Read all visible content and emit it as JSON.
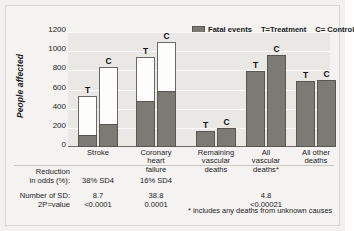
{
  "chart_data": {
    "type": "bar",
    "title": "",
    "ylabel": "People affected",
    "xlabel": "",
    "ylim": [
      0,
      1200
    ],
    "yticks": [
      1200,
      1000,
      800,
      600,
      400,
      200,
      0
    ],
    "grid": true,
    "legend_position": "top-right",
    "stacked": true,
    "categories": [
      "Stroke",
      "Coronary heart failure",
      "Remaining vascular deaths",
      "All vascular deaths*",
      "All other deaths"
    ],
    "category_lines": [
      [
        "Stroke"
      ],
      [
        "Coronary",
        "heart",
        "failure"
      ],
      [
        "Remaining",
        "vascular",
        "deaths"
      ],
      [
        "All",
        "vascular",
        "deaths*"
      ],
      [
        "All other",
        "deaths"
      ]
    ],
    "series": [
      {
        "name": "Treatment",
        "marker": "T",
        "totals": [
          530,
          940,
          165,
          790,
          685
        ],
        "fatal": [
          130,
          480,
          165,
          790,
          685
        ]
      },
      {
        "name": "Control",
        "marker": "C",
        "totals": [
          840,
          1100,
          195,
          960,
          700
        ],
        "fatal": [
          240,
          580,
          195,
          960,
          700
        ]
      }
    ],
    "legend": [
      {
        "icon": "fatal-events-swatch",
        "label": "Fatal events"
      },
      {
        "icon": "",
        "label": "T=Treatment"
      },
      {
        "icon": "",
        "label": "C= Control"
      }
    ],
    "colors": {
      "fatal": "#7b7a75",
      "nonfatal": "#fdfdfc",
      "plot_background": "#e9e8e5",
      "page_background": "#f4f3f1",
      "gridline": "#fafafa",
      "text": "#1a1a1a"
    },
    "annotations": [
      "* includes any deaths from unknown causes"
    ]
  },
  "legend": {
    "fatal_events": "Fatal events",
    "treatment": "T=Treatment",
    "control": "C= Control"
  },
  "axis": {
    "y_title": "People affected",
    "ticks": [
      "1200",
      "1000",
      "800",
      "600",
      "400",
      "200",
      "0"
    ]
  },
  "categories": [
    {
      "lines": [
        "Stroke"
      ]
    },
    {
      "lines": [
        "Coronary",
        "heart",
        "failure"
      ]
    },
    {
      "lines": [
        "Remaining",
        "vascular",
        "deaths"
      ]
    },
    {
      "lines": [
        "All",
        "vascular",
        "deaths*"
      ]
    },
    {
      "lines": [
        "All other",
        "deaths"
      ]
    }
  ],
  "stats": {
    "reduction_label_line1": "Reduction",
    "reduction_label_line2": "in odds (%):",
    "reduction_values": [
      "38% SD4",
      "16% SD4",
      "",
      "",
      ""
    ],
    "sd_label": "Number of SD:",
    "sd_values": [
      "8.7",
      "38.8",
      "",
      "4.8",
      ""
    ],
    "p_label": "2P=value",
    "p_values": [
      "<0.0001",
      "0.0001",
      "",
      "<0.00021",
      ""
    ]
  },
  "footnote": "* includes any deaths from unknown causes"
}
